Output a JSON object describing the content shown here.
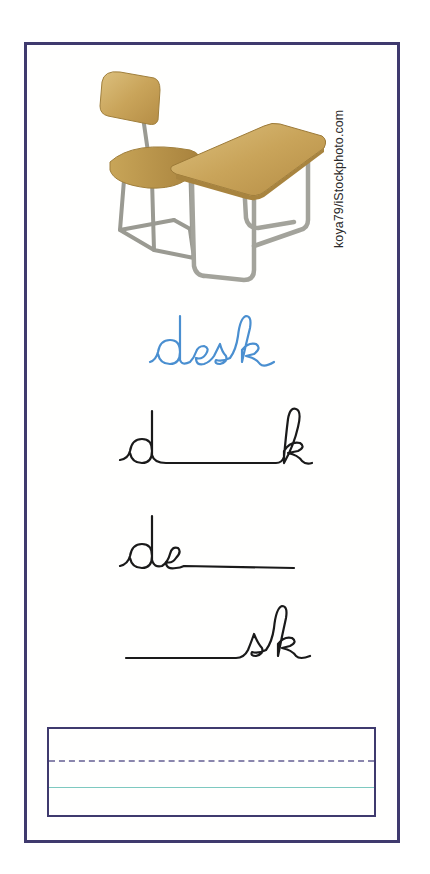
{
  "worksheet": {
    "image_alt": "school desk and chair",
    "credit": "koya79/iStockphoto.com",
    "model_word": "desk",
    "exercises": [
      {
        "prompt": "d___k",
        "given_start": "d",
        "given_end": "k",
        "missing": "es"
      },
      {
        "prompt": "de___",
        "given_start": "de",
        "given_end": "",
        "missing": "sk"
      },
      {
        "prompt": "___sk",
        "given_start": "",
        "given_end": "sk",
        "missing": "de"
      }
    ],
    "writing_area": {
      "label": "handwriting practice lines",
      "lines": [
        "dashed midline",
        "baseline"
      ]
    }
  },
  "colors": {
    "frame": "#3f3a6e",
    "model_word": "#4a8fd0",
    "ink": "#1a1a1a",
    "dashed_line": "#8a86ad",
    "baseline": "#7ec9c0"
  }
}
